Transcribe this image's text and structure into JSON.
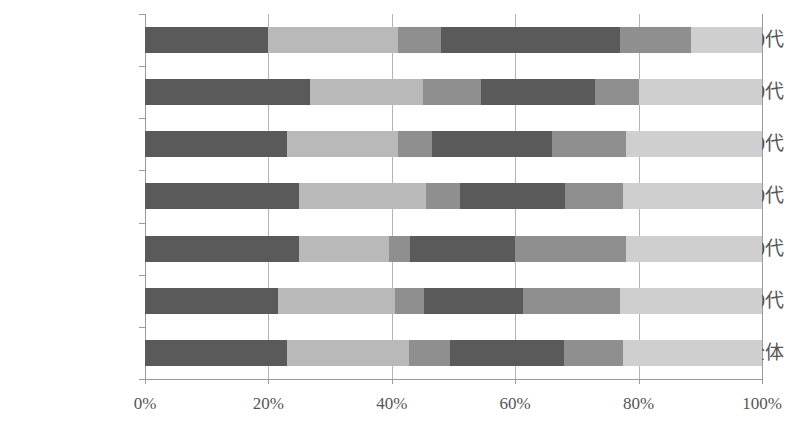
{
  "chart_data": {
    "type": "bar",
    "orientation": "horizontal",
    "stacked": true,
    "normalized": true,
    "title": "",
    "subtitle": "",
    "xlabel": "",
    "ylabel": "",
    "xlim": [
      0,
      100
    ],
    "xticks": [
      0,
      20,
      40,
      60,
      80,
      100
    ],
    "xticklabels": [
      "0%",
      "20%",
      "40%",
      "60%",
      "80%",
      "100%"
    ],
    "grid": true,
    "grid_axis": "x",
    "legend": "none",
    "categories": [
      "女60-70代",
      "男60-70代",
      "女40-50代",
      "男40-50代",
      "女20-30代",
      "男20-30代",
      "全体"
    ],
    "series": [
      {
        "name": "seg1",
        "color": "#5a5a5a",
        "values": [
          20.0,
          26.7,
          23.0,
          25.0,
          25.0,
          21.5,
          23.0
        ]
      },
      {
        "name": "seg2",
        "color": "#b9b9b9",
        "values": [
          21.0,
          18.3,
          18.0,
          20.5,
          14.5,
          19.0,
          19.8
        ]
      },
      {
        "name": "seg3",
        "color": "#8f8f8f",
        "values": [
          7.0,
          9.5,
          5.5,
          5.5,
          3.5,
          4.8,
          6.6
        ]
      },
      {
        "name": "seg4",
        "color": "#5a5a5a",
        "values": [
          29.0,
          18.5,
          19.5,
          17.0,
          17.0,
          16.0,
          18.5
        ]
      },
      {
        "name": "seg5",
        "color": "#8f8f8f",
        "values": [
          11.5,
          7.0,
          12.0,
          9.5,
          18.0,
          15.7,
          9.6
        ]
      },
      {
        "name": "seg6",
        "color": "#cfcfcf",
        "values": [
          11.5,
          20.0,
          22.0,
          22.5,
          22.0,
          23.0,
          22.5
        ]
      }
    ]
  },
  "colors": {
    "axis": "#9b9b9b",
    "gridline": "#b4b4b4",
    "text": "#555555",
    "background": "#ffffff"
  }
}
